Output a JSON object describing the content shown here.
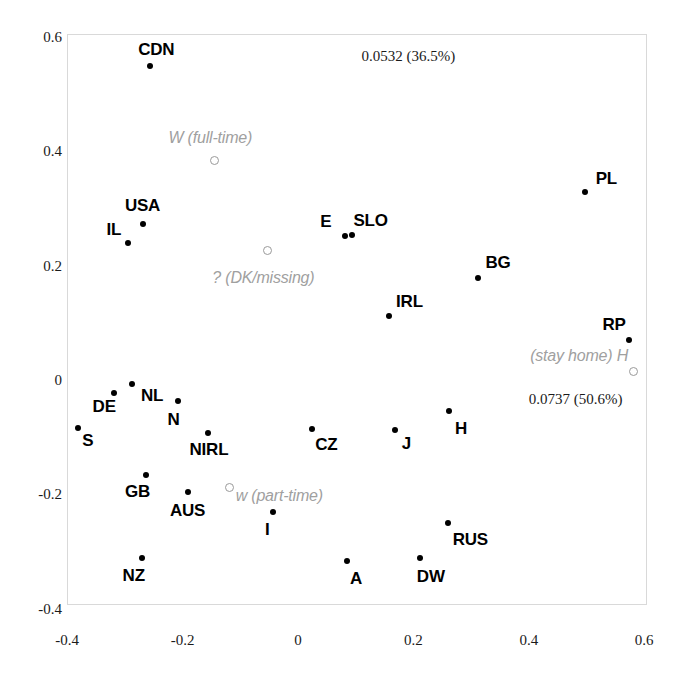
{
  "chart_data": {
    "type": "scatter",
    "title": "",
    "subtitle": "",
    "xlabel": "",
    "ylabel": "",
    "xlim": [
      -0.45,
      0.64
    ],
    "ylim": [
      -0.41,
      0.61
    ],
    "grid": false,
    "legend": "none",
    "xticks": [
      -0.4,
      -0.2,
      0,
      0.2,
      0.4,
      0.6
    ],
    "xticklabels": [
      "-0.4",
      "-0.2",
      "0",
      "0.2",
      "0.4",
      "0.6"
    ],
    "yticks": [
      -0.4,
      -0.2,
      0,
      0.2,
      0.4,
      0.6
    ],
    "yticklabels": [
      "-0.4",
      "-0.2",
      "0",
      "0.2",
      "0.4",
      "0.6"
    ],
    "annotations": [
      {
        "text": "0.0532 (36.5%)",
        "x": 0.11,
        "y": 0.567,
        "align": "start"
      },
      {
        "text": "0.0737 (50.6%)",
        "x": 0.4,
        "y": -0.033,
        "align": "start"
      }
    ],
    "series": [
      {
        "name": "countries",
        "marker": "filled-circle",
        "color": "#000000",
        "points": [
          {
            "label": "CDN",
            "x": -0.256,
            "y": 0.549,
            "lx": -0.277,
            "ly": 0.578,
            "la": "start"
          },
          {
            "label": "USA",
            "x": -0.269,
            "y": 0.273,
            "lx": -0.3,
            "ly": 0.305,
            "la": "start"
          },
          {
            "label": "IL",
            "x": -0.295,
            "y": 0.24,
            "lx": -0.332,
            "ly": 0.262,
            "la": "start"
          },
          {
            "label": "E",
            "x": 0.081,
            "y": 0.252,
            "lx": 0.058,
            "ly": 0.276,
            "la": "end"
          },
          {
            "label": "SLO",
            "x": 0.094,
            "y": 0.254,
            "lx": 0.096,
            "ly": 0.278,
            "la": "start"
          },
          {
            "label": "PL",
            "x": 0.497,
            "y": 0.329,
            "lx": 0.516,
            "ly": 0.352,
            "la": "start"
          },
          {
            "label": "BG",
            "x": 0.312,
            "y": 0.179,
            "lx": 0.325,
            "ly": 0.204,
            "la": "start"
          },
          {
            "label": "IRL",
            "x": 0.157,
            "y": 0.112,
            "lx": 0.17,
            "ly": 0.137,
            "la": "start"
          },
          {
            "label": "RP",
            "x": 0.574,
            "y": 0.07,
            "lx": 0.568,
            "ly": 0.096,
            "la": "end"
          },
          {
            "label": "NL",
            "x": -0.288,
            "y": -0.007,
            "lx": -0.272,
            "ly": -0.028,
            "la": "start"
          },
          {
            "label": "DE",
            "x": -0.319,
            "y": -0.023,
            "lx": -0.356,
            "ly": -0.048,
            "la": "start"
          },
          {
            "label": "S",
            "x": -0.381,
            "y": -0.084,
            "lx": -0.374,
            "ly": -0.106,
            "la": "start"
          },
          {
            "label": "N",
            "x": -0.208,
            "y": -0.037,
            "lx": -0.226,
            "ly": -0.07,
            "la": "start"
          },
          {
            "label": "NIRL",
            "x": -0.156,
            "y": -0.093,
            "lx": -0.188,
            "ly": -0.123,
            "la": "start"
          },
          {
            "label": "CZ",
            "x": 0.024,
            "y": -0.085,
            "lx": 0.03,
            "ly": -0.113,
            "la": "start"
          },
          {
            "label": "J",
            "x": 0.168,
            "y": -0.087,
            "lx": 0.18,
            "ly": -0.112,
            "la": "start"
          },
          {
            "label": "H",
            "x": 0.262,
            "y": -0.055,
            "lx": 0.272,
            "ly": -0.085,
            "la": "start"
          },
          {
            "label": "GB",
            "x": -0.264,
            "y": -0.166,
            "lx": -0.3,
            "ly": -0.196,
            "la": "start"
          },
          {
            "label": "AUS",
            "x": -0.19,
            "y": -0.196,
            "lx": -0.222,
            "ly": -0.23,
            "la": "start"
          },
          {
            "label": "I",
            "x": -0.043,
            "y": -0.231,
            "lx": -0.057,
            "ly": -0.263,
            "la": "start"
          },
          {
            "label": "NZ",
            "x": -0.271,
            "y": -0.312,
            "lx": -0.304,
            "ly": -0.343,
            "la": "start"
          },
          {
            "label": "A",
            "x": 0.085,
            "y": -0.317,
            "lx": 0.09,
            "ly": -0.348,
            "la": "start"
          },
          {
            "label": "DW",
            "x": 0.211,
            "y": -0.312,
            "lx": 0.206,
            "ly": -0.344,
            "la": "start"
          },
          {
            "label": "RUS",
            "x": 0.26,
            "y": -0.25,
            "lx": 0.268,
            "ly": -0.28,
            "la": "start"
          }
        ]
      },
      {
        "name": "supplementary-attitudes",
        "marker": "open-circle",
        "color": "#a0a0a0",
        "points": [
          {
            "label": "W (full-time)",
            "x": -0.146,
            "y": 0.385,
            "lx": -0.152,
            "ly": 0.423,
            "la": "mid"
          },
          {
            "label": "? (DK/missing)",
            "x": -0.055,
            "y": 0.228,
            "lx": -0.06,
            "ly": 0.178,
            "la": "mid"
          },
          {
            "label": "(stay home) H",
            "x": 0.58,
            "y": 0.016,
            "lx": 0.572,
            "ly": 0.042,
            "la": "end"
          },
          {
            "label": "w (part-time)",
            "x": -0.121,
            "y": -0.187,
            "lx": -0.108,
            "ly": -0.203,
            "la": "start"
          }
        ]
      }
    ]
  }
}
